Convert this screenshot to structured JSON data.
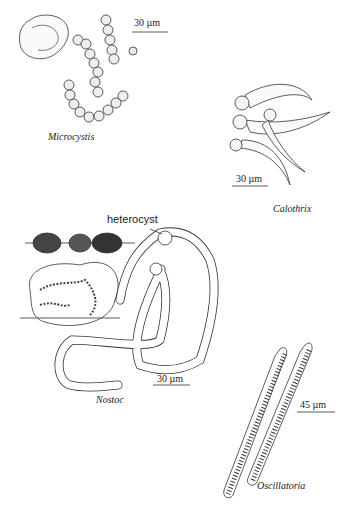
{
  "figure": {
    "organisms": [
      {
        "name": "Microcystis",
        "scale": "30 µm"
      },
      {
        "name": "Calothrix",
        "scale": "30 µm"
      },
      {
        "name": "Nostoc",
        "scale": "30 µm",
        "annotation": "heterocyst"
      },
      {
        "name": "Oscillatoria",
        "scale": "45 µm"
      }
    ]
  }
}
